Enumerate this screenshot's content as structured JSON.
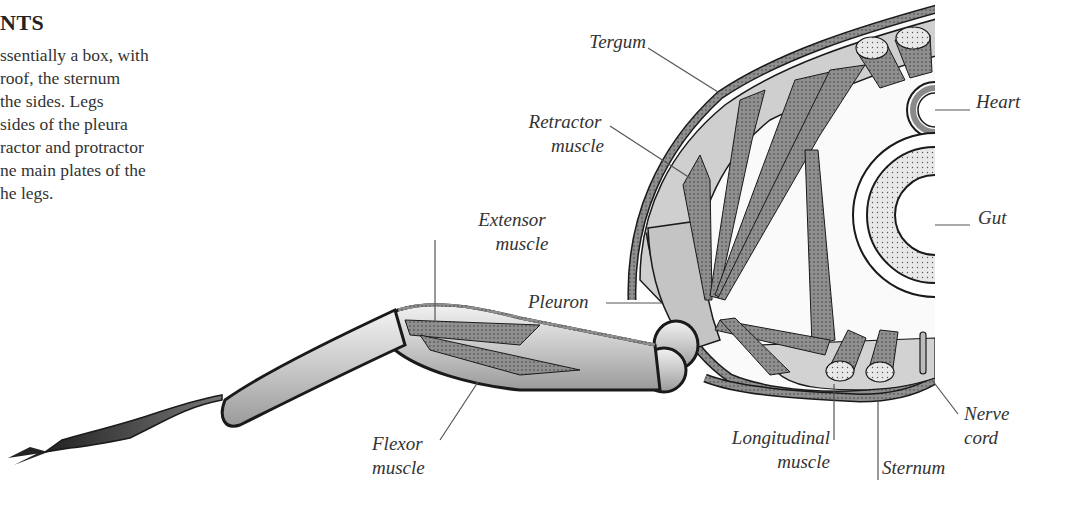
{
  "page": {
    "heading": "NTS",
    "paragraph_lines": [
      "ssentially a box, with",
      " roof, the sternum",
      " the sides. Legs",
      "sides of the pleura",
      "ractor and protractor",
      "ne main plates of the",
      "he legs."
    ]
  },
  "diagram": {
    "colors": {
      "outline": "#1a1a1a",
      "fill_light": "#d6d6d6",
      "fill_mid": "#a8a8a8",
      "fill_dark": "#707070",
      "leader": "#555555"
    },
    "labels": {
      "tergum": [
        "Tergum"
      ],
      "retractor": [
        "Retractor",
        "muscle"
      ],
      "extensor": [
        "Extensor",
        "muscle"
      ],
      "pleuron": [
        "Pleuron"
      ],
      "heart": [
        "Heart"
      ],
      "gut": [
        "Gut"
      ],
      "flexor": [
        "Flexor",
        "muscle"
      ],
      "longitudinal": [
        "Longitudinal",
        "muscle"
      ],
      "sternum": [
        "Sternum"
      ],
      "nerve_cord": [
        "Nerve",
        "cord"
      ]
    }
  }
}
